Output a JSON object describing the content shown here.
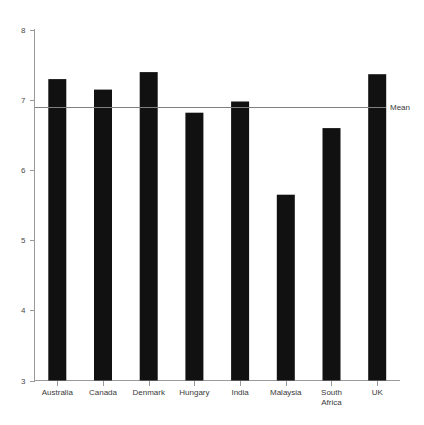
{
  "chart_data": {
    "type": "bar",
    "title": "",
    "subtitle": "",
    "xlabel": "",
    "ylabel": "",
    "categories": [
      "Australia",
      "Canada",
      "Denmark",
      "Hungary",
      "India",
      "Malaysia",
      "South Africa",
      "UK"
    ],
    "category_lines": [
      [
        "Australia"
      ],
      [
        "Canada"
      ],
      [
        "Denmark"
      ],
      [
        "Hungary"
      ],
      [
        "India"
      ],
      [
        "Malaysia"
      ],
      [
        "South",
        "Africa"
      ],
      [
        "UK"
      ]
    ],
    "values": [
      7.3,
      7.15,
      7.4,
      6.82,
      6.98,
      5.65,
      6.6,
      7.37
    ],
    "ylim": [
      3,
      8
    ],
    "yticks": [
      3,
      4,
      5,
      6,
      7,
      8
    ],
    "ytick_labels": [
      "3",
      "4",
      "5",
      "6",
      "7",
      "8"
    ],
    "xtick_marks": true,
    "grid": false,
    "legend": "none",
    "bar_color": "#111111",
    "annotations": [
      {
        "name": "mean-line",
        "label": "Mean",
        "value": 6.9,
        "orientation": "horizontal",
        "color": "#808080"
      }
    ]
  },
  "axes": {
    "y_axis_color": "#9a9a9a",
    "x_axis_color": "#9a9a9a"
  }
}
